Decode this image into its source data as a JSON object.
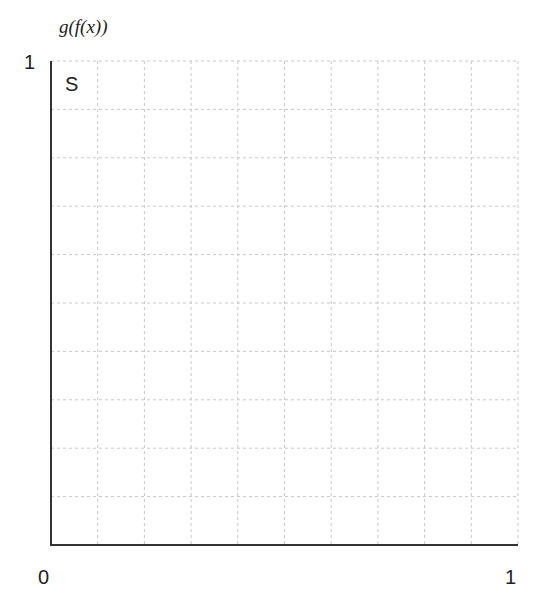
{
  "chart_data": {
    "type": "scatter",
    "title": "",
    "xlabel": "",
    "ylabel": "g(f(x))",
    "xlim": [
      0,
      1
    ],
    "ylim": [
      0,
      1
    ],
    "x_tick_labels": [
      "0",
      "1"
    ],
    "y_tick_labels": [
      "1"
    ],
    "grid": true,
    "grid_style": "dashed",
    "grid_divisions": {
      "x": 10,
      "y": 10
    },
    "series": [],
    "annotations": [
      {
        "text": "S",
        "x": 0.03,
        "y": 0.96
      }
    ],
    "legend": null
  },
  "labels": {
    "ylabel": "g(f(x))",
    "y_tick_max": "1",
    "x_tick_min": "0",
    "x_tick_max": "1",
    "region": "S"
  },
  "colors": {
    "axis": "#333333",
    "grid": "#c8c8c8",
    "text": "#222222",
    "background": "#ffffff"
  }
}
